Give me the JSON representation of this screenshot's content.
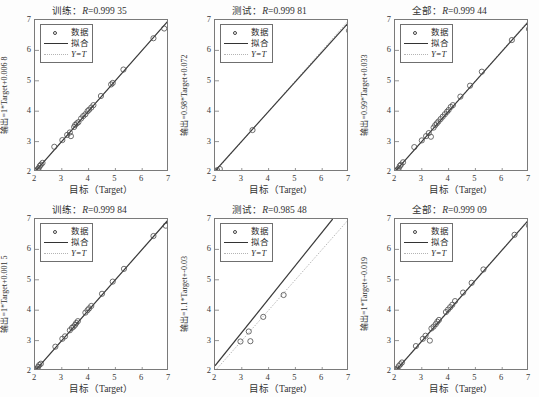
{
  "figure": {
    "axis_label_x": "目标（Target）",
    "legend": {
      "data_label": "数据",
      "fit_label": "拟合",
      "identity_label": "Y=T"
    },
    "ticks": {
      "x": [
        "2",
        "3",
        "4",
        "5",
        "6",
        "7"
      ],
      "y": [
        "2",
        "3",
        "4",
        "5",
        "6",
        "7"
      ]
    }
  },
  "chart_data": [
    {
      "type": "scatter",
      "title": "训练：R=0.999 35",
      "title_prefix": "训练：",
      "r_label": "R",
      "r_value": "=0.999 35",
      "xlabel": "目标（Target）",
      "ylabel": "输出=1*Target+0.006 8",
      "xlim": [
        2,
        7
      ],
      "ylim": [
        2,
        7
      ],
      "grid": false,
      "legend_position": "upper-left",
      "fit_slope": 1.0,
      "fit_intercept": 0.0068,
      "r": 0.99935,
      "points": [
        [
          2.02,
          2.02
        ],
        [
          2.06,
          2.05
        ],
        [
          2.1,
          2.09
        ],
        [
          2.14,
          2.13
        ],
        [
          2.18,
          2.2
        ],
        [
          2.22,
          2.24
        ],
        [
          2.28,
          2.3
        ],
        [
          2.72,
          2.83
        ],
        [
          3.02,
          3.05
        ],
        [
          3.2,
          3.22
        ],
        [
          3.3,
          3.3
        ],
        [
          3.34,
          3.18
        ],
        [
          3.46,
          3.48
        ],
        [
          3.5,
          3.55
        ],
        [
          3.56,
          3.6
        ],
        [
          3.62,
          3.64
        ],
        [
          3.72,
          3.76
        ],
        [
          3.8,
          3.84
        ],
        [
          3.88,
          3.9
        ],
        [
          3.96,
          4.0
        ],
        [
          4.02,
          4.05
        ],
        [
          4.1,
          4.12
        ],
        [
          4.18,
          4.2
        ],
        [
          4.46,
          4.5
        ],
        [
          4.84,
          4.88
        ],
        [
          4.9,
          4.93
        ],
        [
          5.3,
          5.37
        ],
        [
          6.42,
          6.4
        ],
        [
          6.82,
          6.72
        ]
      ]
    },
    {
      "type": "scatter",
      "title": "测试：R=0.999 81",
      "title_prefix": "测试：",
      "r_label": "R",
      "r_value": "=0.999 81",
      "xlabel": "目标（Target）",
      "ylabel": "输出=0.98*Target+0.072",
      "xlim": [
        2,
        7
      ],
      "ylim": [
        2,
        7
      ],
      "grid": false,
      "legend_position": "upper-left",
      "fit_slope": 0.98,
      "fit_intercept": 0.072,
      "r": 0.99981,
      "points": [
        [
          2.04,
          2.02
        ],
        [
          2.08,
          2.06
        ],
        [
          2.18,
          2.1
        ],
        [
          3.4,
          3.38
        ],
        [
          7.0,
          6.65
        ]
      ]
    },
    {
      "type": "scatter",
      "title": "全部：R=0.999 44",
      "title_prefix": "全部：",
      "r_label": "R",
      "r_value": "=0.999 44",
      "xlabel": "目标（Target）",
      "ylabel": "输出=0.99*Target+0.033",
      "xlim": [
        2,
        7
      ],
      "ylim": [
        2,
        7
      ],
      "grid": false,
      "legend_position": "upper-left",
      "fit_slope": 0.99,
      "fit_intercept": 0.033,
      "r": 0.99944,
      "points": [
        [
          2.02,
          2.02
        ],
        [
          2.06,
          2.05
        ],
        [
          2.1,
          2.08
        ],
        [
          2.14,
          2.12
        ],
        [
          2.18,
          2.2
        ],
        [
          2.22,
          2.24
        ],
        [
          2.3,
          2.32
        ],
        [
          2.72,
          2.82
        ],
        [
          3.0,
          3.04
        ],
        [
          3.16,
          3.18
        ],
        [
          3.26,
          3.28
        ],
        [
          3.34,
          3.16
        ],
        [
          3.44,
          3.46
        ],
        [
          3.5,
          3.54
        ],
        [
          3.56,
          3.6
        ],
        [
          3.62,
          3.66
        ],
        [
          3.7,
          3.74
        ],
        [
          3.78,
          3.82
        ],
        [
          3.86,
          3.9
        ],
        [
          3.94,
          3.98
        ],
        [
          4.0,
          4.04
        ],
        [
          4.08,
          4.14
        ],
        [
          4.16,
          4.2
        ],
        [
          4.44,
          4.48
        ],
        [
          4.8,
          4.84
        ],
        [
          5.24,
          5.3
        ],
        [
          6.36,
          6.34
        ],
        [
          7.0,
          6.7
        ]
      ]
    },
    {
      "type": "scatter",
      "title": "训练：R=0.999 84",
      "title_prefix": "训练：",
      "r_label": "R",
      "r_value": "=0.999 84",
      "xlabel": "目标（Target）",
      "ylabel": "输出=1*Target+0.001 5",
      "xlim": [
        2,
        7
      ],
      "ylim": [
        2,
        7
      ],
      "grid": false,
      "legend_position": "upper-left",
      "fit_slope": 1.0,
      "fit_intercept": 0.0015,
      "r": 0.99984,
      "points": [
        [
          2.0,
          2.0
        ],
        [
          2.04,
          2.04
        ],
        [
          2.08,
          2.08
        ],
        [
          2.12,
          2.14
        ],
        [
          2.16,
          2.2
        ],
        [
          2.22,
          2.24
        ],
        [
          2.76,
          2.8
        ],
        [
          3.02,
          3.06
        ],
        [
          3.12,
          3.14
        ],
        [
          3.3,
          3.34
        ],
        [
          3.38,
          3.42
        ],
        [
          3.44,
          3.46
        ],
        [
          3.5,
          3.52
        ],
        [
          3.54,
          3.58
        ],
        [
          3.6,
          3.64
        ],
        [
          3.88,
          3.92
        ],
        [
          3.96,
          4.0
        ],
        [
          4.02,
          4.06
        ],
        [
          4.1,
          4.14
        ],
        [
          4.5,
          4.54
        ],
        [
          4.9,
          4.94
        ],
        [
          5.32,
          5.36
        ],
        [
          6.42,
          6.44
        ],
        [
          6.88,
          6.78
        ]
      ]
    },
    {
      "type": "scatter",
      "title": "测试：R=0.985 48",
      "title_prefix": "测试：",
      "r_label": "R",
      "r_value": "=0.985 48",
      "xlabel": "目标（Target）",
      "ylabel": "输出=1.1*Target+-0.03",
      "xlim": [
        2,
        7
      ],
      "ylim": [
        2,
        7
      ],
      "grid": false,
      "legend_position": "upper-left",
      "fit_slope": 1.1,
      "fit_intercept": -0.03,
      "r": 0.98548,
      "points": [
        [
          2.95,
          2.97
        ],
        [
          3.26,
          3.3
        ],
        [
          3.32,
          2.98
        ],
        [
          3.8,
          3.78
        ],
        [
          4.56,
          4.5
        ]
      ]
    },
    {
      "type": "scatter",
      "title": "全部：R=0.999 09",
      "title_prefix": "全部：",
      "r_label": "R",
      "r_value": "=0.999 09",
      "xlabel": "目标（Target）",
      "ylabel": "输出=1*Target+-0.019",
      "xlim": [
        2,
        7
      ],
      "ylim": [
        2,
        7
      ],
      "grid": false,
      "legend_position": "upper-left",
      "fit_slope": 1.0,
      "fit_intercept": -0.019,
      "r": 0.99909,
      "points": [
        [
          2.0,
          2.0
        ],
        [
          2.04,
          2.04
        ],
        [
          2.08,
          2.08
        ],
        [
          2.14,
          2.16
        ],
        [
          2.2,
          2.22
        ],
        [
          2.26,
          2.28
        ],
        [
          2.78,
          2.82
        ],
        [
          3.04,
          3.06
        ],
        [
          3.14,
          3.16
        ],
        [
          3.3,
          3.0
        ],
        [
          3.36,
          3.4
        ],
        [
          3.44,
          3.46
        ],
        [
          3.52,
          3.54
        ],
        [
          3.58,
          3.62
        ],
        [
          3.64,
          3.68
        ],
        [
          3.9,
          3.94
        ],
        [
          3.98,
          4.02
        ],
        [
          4.06,
          4.1
        ],
        [
          4.14,
          4.18
        ],
        [
          4.24,
          4.3
        ],
        [
          4.54,
          4.58
        ],
        [
          4.86,
          4.9
        ],
        [
          5.3,
          5.34
        ],
        [
          6.46,
          6.48
        ],
        [
          7.0,
          6.78
        ]
      ]
    }
  ]
}
